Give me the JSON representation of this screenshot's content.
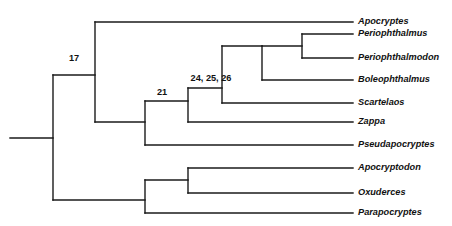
{
  "figure": {
    "kind": "cladogram",
    "background_color": "#ffffff",
    "line_color": "#1a1a1a",
    "text_color": "#111111",
    "width": 452,
    "height": 226
  },
  "taxa": [
    {
      "id": "apocryptes",
      "label": "Apocryptes",
      "tip_y": 22,
      "branch_x": 95,
      "label_x": 358
    },
    {
      "id": "periophthalmus",
      "label": "Periophthalmus",
      "tip_y": 34,
      "branch_x": 302,
      "label_x": 358
    },
    {
      "id": "periophthalmodon",
      "label": "Periophthalmodon",
      "tip_y": 58,
      "branch_x": 302,
      "label_x": 358
    },
    {
      "id": "boleophthalmus",
      "label": "Boleophthalmus",
      "tip_y": 80,
      "branch_x": 262,
      "label_x": 358
    },
    {
      "id": "scartelaos",
      "label": "Scartelaos",
      "tip_y": 103,
      "branch_x": 222,
      "label_x": 358
    },
    {
      "id": "zappa",
      "label": "Zappa",
      "tip_y": 122,
      "branch_x": 188,
      "label_x": 358
    },
    {
      "id": "pseudapocryptes",
      "label": "Pseudapocryptes",
      "tip_y": 145,
      "branch_x": 145,
      "label_x": 358
    },
    {
      "id": "apocryptodon",
      "label": "Apocryptodon",
      "tip_y": 168,
      "branch_x": 188,
      "label_x": 358
    },
    {
      "id": "oxuderces",
      "label": "Oxuderces",
      "tip_y": 193,
      "branch_x": 188,
      "label_x": 358
    },
    {
      "id": "parapocryptes",
      "label": "Parapocryptes",
      "tip_y": 213,
      "branch_x": 145,
      "label_x": 358
    }
  ],
  "node_labels": [
    {
      "id": "node-17",
      "text": "17",
      "x": 74,
      "y": 59
    },
    {
      "id": "node-21",
      "text": "21",
      "x": 162,
      "y": 93
    },
    {
      "id": "node-24-25-26",
      "text": "24, 25, 26",
      "x": 211,
      "y": 79
    }
  ],
  "structure": {
    "root_stem": {
      "x1": 10,
      "x2": 53,
      "y": 138
    },
    "verticals": [
      {
        "id": "root-split",
        "x": 53,
        "y1": 75,
        "y2": 200
      },
      {
        "id": "clade-17",
        "x": 95,
        "y1": 22,
        "y2": 122
      },
      {
        "id": "clade-21",
        "x": 145,
        "y1": 101,
        "y2": 145
      },
      {
        "id": "clade-24-25-26",
        "x": 188,
        "y1": 88,
        "y2": 122
      },
      {
        "id": "clade-mudskipper",
        "x": 222,
        "y1": 46,
        "y2": 103
      },
      {
        "id": "clade-boleo",
        "x": 262,
        "y1": 46,
        "y2": 80
      },
      {
        "id": "clade-perioph",
        "x": 302,
        "y1": 34,
        "y2": 58
      },
      {
        "id": "clade-lower",
        "x": 145,
        "y1": 180,
        "y2": 213
      },
      {
        "id": "clade-apoc-oxud",
        "x": 188,
        "y1": 168,
        "y2": 193
      }
    ],
    "connectors": [
      {
        "id": "to-clade-17",
        "x1": 53,
        "x2": 95,
        "y": 75
      },
      {
        "id": "to-clade-lower",
        "x1": 53,
        "x2": 145,
        "y": 200
      },
      {
        "id": "to-clade-21",
        "x1": 95,
        "x2": 145,
        "y": 122
      },
      {
        "id": "to-clade-24-25-26",
        "x1": 145,
        "x2": 188,
        "y": 101
      },
      {
        "id": "to-clade-mudskipper",
        "x1": 188,
        "x2": 222,
        "y": 88
      },
      {
        "id": "to-clade-boleo",
        "x1": 222,
        "x2": 262,
        "y": 46
      },
      {
        "id": "to-clade-perioph",
        "x1": 262,
        "x2": 302,
        "y": 46
      },
      {
        "id": "to-clade-apoc-oxud",
        "x1": 145,
        "x2": 188,
        "y": 180
      }
    ]
  }
}
